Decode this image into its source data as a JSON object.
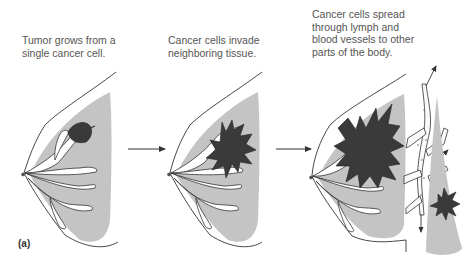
{
  "figure": {
    "panel_label": "(a)",
    "steps": [
      {
        "caption_line1": "Tumor grows from a",
        "caption_line2": "single cancer cell."
      },
      {
        "caption_line1": "Cancer cells invade",
        "caption_line2": "neighboring tissue."
      },
      {
        "caption_line1": "Cancer cells spread",
        "caption_line2": "through lymph and",
        "caption_line3": "blood vessels to other",
        "caption_line4": "parts of the body."
      }
    ]
  },
  "colors": {
    "tissue_gray": "#c4c4c4",
    "tumor_dark": "#3a3a3a",
    "outline": "#333333",
    "text": "#555555"
  }
}
